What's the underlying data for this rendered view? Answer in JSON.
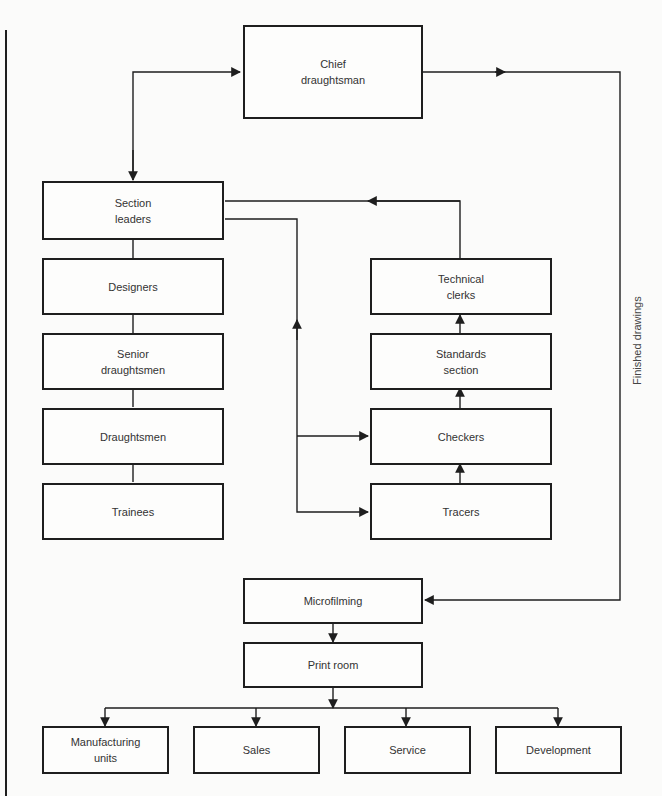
{
  "diagram": {
    "type": "organisation-flowchart",
    "boxes": {
      "chief": "Chief\ndraughtsman",
      "section_leaders": "Section\nleaders",
      "designers": "Designers",
      "senior": "Senior\ndraughtsmen",
      "draughtsmen": "Draughtsmen",
      "trainees": "Trainees",
      "technical_clerks": "Technical\nclerks",
      "standards": "Standards\nsection",
      "checkers": "Checkers",
      "tracers": "Tracers",
      "microfilming": "Microfilming",
      "print_room": "Print room",
      "manufacturing": "Manufacturing\nunits",
      "sales": "Sales",
      "service": "Service",
      "development": "Development"
    },
    "labels": {
      "finished_drawings": "Finished drawings"
    },
    "colors": {
      "line": "#1e1e1e",
      "background": "#fbfbfa"
    }
  }
}
